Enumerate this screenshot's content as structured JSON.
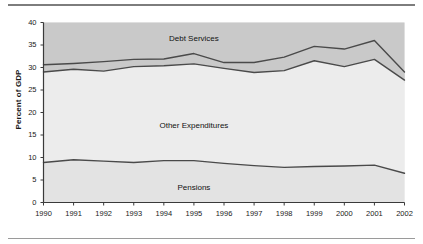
{
  "figure": {
    "has_top_rule": true,
    "has_bottom_rule": true,
    "rule_color": "#8a8a8a",
    "background": "#ffffff"
  },
  "chart_data": {
    "type": "area",
    "title": "",
    "subtitle": "",
    "xlabel": "",
    "ylabel": "Percent of GDP",
    "xlim": [
      1990,
      2002
    ],
    "ylim": [
      0,
      40
    ],
    "ytick_labels": [
      "0",
      "5",
      "10",
      "15",
      "20",
      "25",
      "30",
      "35",
      "40"
    ],
    "ytick_values": [
      0,
      5,
      10,
      15,
      20,
      25,
      30,
      35,
      40
    ],
    "categories": [
      1990,
      1991,
      1992,
      1993,
      1994,
      1995,
      1996,
      1997,
      1998,
      1999,
      2000,
      2001,
      2002
    ],
    "xtick_labels": [
      "1990",
      "1991",
      "1992",
      "1993",
      "1994",
      "1995",
      "1996",
      "1997",
      "1998",
      "1999",
      "2000",
      "2001",
      "2002"
    ],
    "grid": false,
    "legend_position": "inline-annotations",
    "stacked": true,
    "series": [
      {
        "name": "Pensions",
        "label_position": "inside-bottom",
        "band_color": "#e3e3e3",
        "line_color": "#4a4a4a",
        "values": [
          8.9,
          9.5,
          9.2,
          8.9,
          9.3,
          9.3,
          8.7,
          8.2,
          7.8,
          8.0,
          8.1,
          8.3,
          6.5
        ],
        "cumulative": [
          8.9,
          9.5,
          9.2,
          8.9,
          9.3,
          9.3,
          8.7,
          8.2,
          7.8,
          8.0,
          8.1,
          8.3,
          6.5
        ]
      },
      {
        "name": "Other Expenditures",
        "label_position": "inside-middle",
        "band_color": "#ececec",
        "line_color": "#4a4a4a",
        "values": [
          20.1,
          20.1,
          20.0,
          21.3,
          21.1,
          21.5,
          21.1,
          20.7,
          21.5,
          23.5,
          22.1,
          23.5,
          20.7
        ],
        "cumulative": [
          29.0,
          29.6,
          29.2,
          30.2,
          30.4,
          30.8,
          29.8,
          28.9,
          29.3,
          31.5,
          30.2,
          31.8,
          27.2
        ]
      },
      {
        "name": "Debt Services",
        "label_position": "inside-top",
        "band_color": "#c9c9c9",
        "line_color": "#4a4a4a",
        "values": [
          1.6,
          1.3,
          2.1,
          1.6,
          1.5,
          2.3,
          1.3,
          2.2,
          3.0,
          3.2,
          3.9,
          4.2,
          1.8
        ],
        "cumulative": [
          30.6,
          30.9,
          31.3,
          31.8,
          31.9,
          33.1,
          31.1,
          31.1,
          32.3,
          34.7,
          34.1,
          36.0,
          29.0
        ]
      }
    ],
    "annotations": [
      {
        "text": "Debt Services",
        "x": 1995.0,
        "y": 36.4
      },
      {
        "text": "Other Expenditures",
        "x": 1995.0,
        "y": 17.0
      },
      {
        "text": "Pensions",
        "x": 1995.0,
        "y": 3.3
      }
    ],
    "upper_shaded_region": {
      "description": "grey band above 26.6 percent of GDP spanning full plot width",
      "y_start": 26.6,
      "color": "#c9c9c9"
    }
  }
}
